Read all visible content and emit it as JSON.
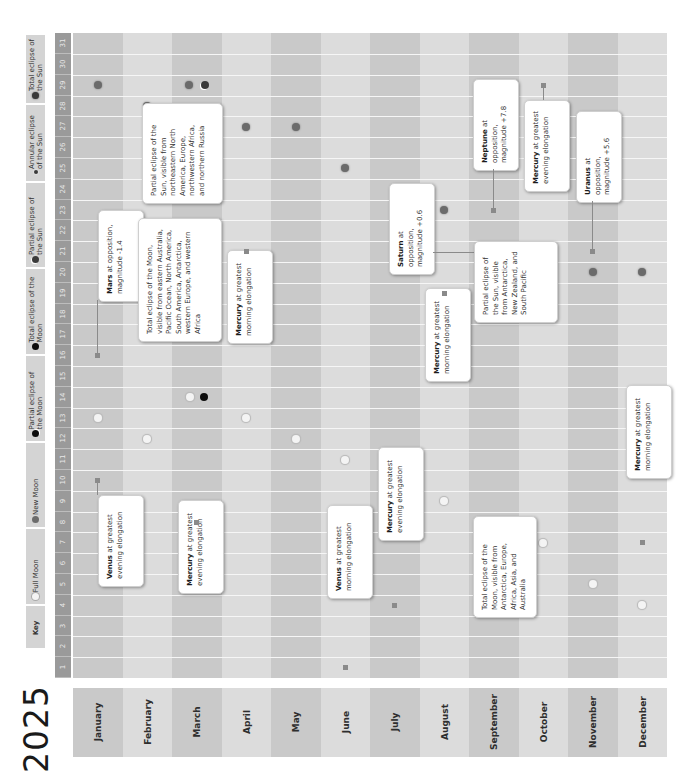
{
  "title": "2025",
  "key": {
    "label": "Key",
    "items": [
      {
        "id": "full",
        "label": "Full Moon",
        "icon": "full-moon-icon",
        "color": "#f4f4f4"
      },
      {
        "id": "new",
        "label": "New Moon",
        "icon": "new-moon-icon",
        "color": "#6b6b6b"
      },
      {
        "id": "plunar",
        "label": "Partial eclipse of the Moon",
        "icon": "partial-lunar-eclipse-icon",
        "color": "#0d0d0d"
      },
      {
        "id": "tlunar",
        "label": "Total eclipse of the Moon",
        "icon": "total-lunar-eclipse-icon",
        "color": "#0d0d0d"
      },
      {
        "id": "psolar",
        "label": "Partial eclipse of the Sun",
        "icon": "partial-solar-eclipse-icon",
        "color": "#3a3a3a"
      },
      {
        "id": "asolar",
        "label": "Annular eclipse of the Sun",
        "icon": "annular-solar-eclipse-icon",
        "color": "#3a3a3a"
      },
      {
        "id": "tsolar",
        "label": "Total eclipse of the Sun",
        "icon": "total-solar-eclipse-icon",
        "color": "#3a3a3a"
      }
    ]
  },
  "days": [
    "1",
    "2",
    "3",
    "4",
    "5",
    "6",
    "7",
    "8",
    "9",
    "10",
    "11",
    "12",
    "13",
    "14",
    "15",
    "16",
    "17",
    "18",
    "19",
    "20",
    "21",
    "22",
    "23",
    "24",
    "25",
    "26",
    "27",
    "28",
    "29",
    "30",
    "31"
  ],
  "months": [
    "January",
    "February",
    "March",
    "April",
    "May",
    "June",
    "July",
    "August",
    "September",
    "October",
    "November",
    "December"
  ],
  "colors": {
    "month_dark": "#c9c9c9",
    "month_light": "#dcdcdc",
    "day_strip": "#9a9a9a",
    "key_strip": "#d4d4d4"
  },
  "chart_data": {
    "type": "table",
    "title": "2025",
    "xlabel": "Month",
    "ylabel": "Day of month",
    "categories": [
      "January",
      "February",
      "March",
      "April",
      "May",
      "June",
      "July",
      "August",
      "September",
      "October",
      "November",
      "December"
    ],
    "day_range": [
      1,
      31
    ],
    "legend": [
      "Full Moon",
      "New Moon",
      "Partial eclipse of the Moon",
      "Total eclipse of the Moon",
      "Partial eclipse of the Sun",
      "Annular eclipse of the Sun",
      "Total eclipse of the Sun"
    ],
    "series": [
      {
        "name": "Full Moon",
        "points": [
          {
            "month": "January",
            "day": 13
          },
          {
            "month": "February",
            "day": 12
          },
          {
            "month": "March",
            "day": 14
          },
          {
            "month": "April",
            "day": 13
          },
          {
            "month": "May",
            "day": 12
          },
          {
            "month": "June",
            "day": 11
          },
          {
            "month": "July",
            "day": 10
          },
          {
            "month": "August",
            "day": 9
          },
          {
            "month": "September",
            "day": 7
          },
          {
            "month": "October",
            "day": 7
          },
          {
            "month": "November",
            "day": 5
          },
          {
            "month": "December",
            "day": 4
          }
        ]
      },
      {
        "name": "New Moon",
        "points": [
          {
            "month": "January",
            "day": 29
          },
          {
            "month": "February",
            "day": 28
          },
          {
            "month": "March",
            "day": 29
          },
          {
            "month": "April",
            "day": 27
          },
          {
            "month": "May",
            "day": 27
          },
          {
            "month": "June",
            "day": 25
          },
          {
            "month": "July",
            "day": 24
          },
          {
            "month": "August",
            "day": 23
          },
          {
            "month": "September",
            "day": 21
          },
          {
            "month": "October",
            "day": 21
          },
          {
            "month": "November",
            "day": 20
          },
          {
            "month": "December",
            "day": 20
          }
        ]
      },
      {
        "name": "Total eclipse of the Moon",
        "points": [
          {
            "month": "March",
            "day": 14
          },
          {
            "month": "September",
            "day": 7
          }
        ]
      },
      {
        "name": "Partial eclipse of the Sun",
        "points": [
          {
            "month": "March",
            "day": 29
          },
          {
            "month": "September",
            "day": 21
          }
        ]
      }
    ],
    "annotations": [
      {
        "month": "January",
        "day": 10,
        "bold": "Venus",
        "text": "at greatest evening elongation"
      },
      {
        "month": "January",
        "day": 16,
        "bold": "Mars",
        "text": "at opposition, magnitude -1.4"
      },
      {
        "month": "March",
        "day": 8,
        "bold": "Mercury",
        "text": "at greatest evening elongation"
      },
      {
        "month": "March",
        "day": 14,
        "bold": "",
        "text": "Total eclipse of the Moon, visible from eastern Australia, Pacific Ocean, North America, South America, Antarctica, western Europe, and western Africa"
      },
      {
        "month": "March",
        "day": 29,
        "bold": "",
        "text": "Partial eclipse of the Sun, visible from northeastern North America, Europe, northwestern Africa, and northern Russia"
      },
      {
        "month": "April",
        "day": 21,
        "bold": "Mercury",
        "text": "at greatest morning elongation"
      },
      {
        "month": "June",
        "day": 1,
        "bold": "Venus",
        "text": "at greatest morning elongation"
      },
      {
        "month": "July",
        "day": 4,
        "bold": "Mercury",
        "text": "at greatest evening elongation"
      },
      {
        "month": "August",
        "day": 19,
        "bold": "Mercury",
        "text": "at greatest morning elongation"
      },
      {
        "month": "September",
        "day": 7,
        "bold": "",
        "text": "Total eclipse of the Moon, visible from Antarctica, Europe, Africa, Asia, and Australia"
      },
      {
        "month": "September",
        "day": 21,
        "bold": "Saturn",
        "text": "at opposition, magnitude +0.6"
      },
      {
        "month": "September",
        "day": 21,
        "bold": "",
        "text": "Partial eclipse of the Sun, visible from Antarctica, New Zealand, and South Pacific"
      },
      {
        "month": "September",
        "day": 23,
        "bold": "Neptune",
        "text": "at opposition, magnitude +7.8"
      },
      {
        "month": "October",
        "day": 29,
        "bold": "Mercury",
        "text": "at greatest evening elongation"
      },
      {
        "month": "November",
        "day": 21,
        "bold": "Uranus",
        "text": "at opposition, magnitude +5.6"
      },
      {
        "month": "December",
        "day": 7,
        "bold": "Mercury",
        "text": "at greatest morning elongation"
      }
    ]
  }
}
